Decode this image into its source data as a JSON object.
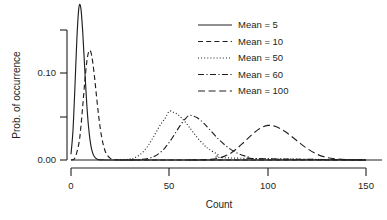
{
  "chart_data": {
    "type": "line",
    "title": "",
    "xlabel": "Count",
    "ylabel": "Prob. of occurrence",
    "xlim": [
      0,
      150
    ],
    "ylim": [
      0.0,
      0.15
    ],
    "grid": false,
    "legend_position": "top-right",
    "x_ticks": [
      0,
      50,
      100,
      150
    ],
    "x_tick_labels": [
      "0",
      "50",
      "100",
      "150"
    ],
    "y_ticks": [
      0.0,
      0.05,
      0.1,
      0.15
    ],
    "y_tick_labels": [
      "0.00",
      "",
      "0.10",
      ""
    ],
    "distribution": "Poisson probability mass functions",
    "series": [
      {
        "name": "Mean = 5",
        "mean": 5,
        "linestyle": "solid",
        "peak_x": 5,
        "peak_y": 0.1755,
        "x": [
          0,
          1,
          2,
          3,
          4,
          5,
          6,
          7,
          8,
          9,
          10,
          11,
          12,
          13,
          14,
          15,
          16,
          17,
          18,
          19,
          20,
          22,
          25,
          30,
          150
        ],
        "y": [
          0.0067,
          0.0337,
          0.0842,
          0.1404,
          0.1755,
          0.1755,
          0.1462,
          0.1044,
          0.0653,
          0.0363,
          0.0181,
          0.0082,
          0.0034,
          0.0013,
          0.0005,
          0.0002,
          0.0001,
          0.0,
          0.0,
          0.0,
          0.0,
          0.0,
          0.0,
          0.0,
          0.0
        ]
      },
      {
        "name": "Mean = 10",
        "mean": 10,
        "linestyle": "dashed",
        "peak_x": 10,
        "peak_y": 0.1251,
        "x": [
          0,
          2,
          4,
          5,
          6,
          7,
          8,
          9,
          10,
          11,
          12,
          13,
          14,
          15,
          16,
          17,
          18,
          20,
          22,
          25,
          30,
          35,
          150
        ],
        "y": [
          0.0,
          0.0023,
          0.0189,
          0.0378,
          0.0631,
          0.0901,
          0.1126,
          0.1251,
          0.1251,
          0.1137,
          0.0948,
          0.0729,
          0.0521,
          0.0347,
          0.0217,
          0.0128,
          0.0071,
          0.0019,
          0.0005,
          0.0001,
          0.0,
          0.0,
          0.0
        ]
      },
      {
        "name": "Mean = 50",
        "mean": 50,
        "linestyle": "dotted",
        "peak_x": 50,
        "peak_y": 0.0563,
        "x": [
          25,
          30,
          32,
          35,
          38,
          40,
          42,
          44,
          46,
          48,
          50,
          52,
          54,
          56,
          58,
          60,
          62,
          65,
          68,
          70,
          75,
          80,
          150
        ],
        "y": [
          0.0001,
          0.001,
          0.0022,
          0.006,
          0.0129,
          0.0194,
          0.027,
          0.035,
          0.0424,
          0.0486,
          0.0563,
          0.0551,
          0.0529,
          0.049,
          0.044,
          0.0383,
          0.0323,
          0.0238,
          0.0167,
          0.0128,
          0.006,
          0.0024,
          0.0
        ]
      },
      {
        "name": "Mean = 60",
        "mean": 60,
        "linestyle": "dashdot",
        "peak_x": 60,
        "peak_y": 0.0514,
        "x": [
          30,
          35,
          40,
          43,
          46,
          48,
          50,
          52,
          54,
          56,
          58,
          60,
          62,
          64,
          66,
          68,
          70,
          75,
          80,
          85,
          90,
          95,
          150
        ],
        "y": [
          0.0,
          0.0004,
          0.0022,
          0.0049,
          0.0098,
          0.0146,
          0.0205,
          0.0273,
          0.0345,
          0.0414,
          0.0472,
          0.0514,
          0.0509,
          0.0489,
          0.0456,
          0.0413,
          0.0364,
          0.0241,
          0.0142,
          0.0075,
          0.0036,
          0.0016,
          0.0
        ]
      },
      {
        "name": "Mean = 100",
        "mean": 100,
        "linestyle": "longdash",
        "peak_x": 100,
        "peak_y": 0.0399,
        "x": [
          60,
          65,
          70,
          75,
          80,
          84,
          88,
          92,
          96,
          100,
          104,
          108,
          112,
          116,
          120,
          125,
          130,
          135,
          140,
          145,
          150
        ],
        "y": [
          0.0,
          0.0002,
          0.0006,
          0.0021,
          0.0063,
          0.0125,
          0.0207,
          0.0293,
          0.0363,
          0.0399,
          0.0387,
          0.0341,
          0.0275,
          0.0202,
          0.0134,
          0.0067,
          0.003,
          0.0012,
          0.0004,
          0.0001,
          0.0
        ]
      }
    ]
  },
  "legend": {
    "items": [
      {
        "label": "Mean = 5"
      },
      {
        "label": "Mean = 10"
      },
      {
        "label": "Mean = 50"
      },
      {
        "label": "Mean = 60"
      },
      {
        "label": "Mean = 100"
      }
    ]
  },
  "axes": {
    "x_label": "Count",
    "y_label": "Prob. of occurrence",
    "x_tick_labels": [
      "0",
      "50",
      "100",
      "150"
    ],
    "y_tick_labels": [
      "0.00",
      "0.10"
    ]
  },
  "colors": {
    "ink": "#231f20",
    "background": "#ffffff"
  }
}
